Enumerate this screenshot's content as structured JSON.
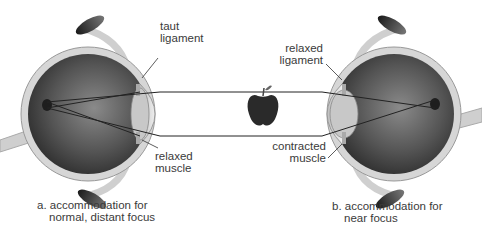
{
  "diagram": {
    "object": "apple-icon",
    "colors": {
      "eyeball_dark": "#3a3a3a",
      "eyeball_mid": "#6e6e6e",
      "sclera": "#d4d4d4",
      "lens": "#c9c9c9",
      "ray": "#222222",
      "apple": "#2a2a2a"
    },
    "panels": [
      {
        "id": "a",
        "caption_line1": "a. accommodation for",
        "caption_line2": "normal, distant focus",
        "ligament_label_line1": "taut",
        "ligament_label_line2": "ligament",
        "muscle_label_line1": "relaxed",
        "muscle_label_line2": "muscle"
      },
      {
        "id": "b",
        "caption_line1": "b. accommodation for",
        "caption_line2": "near focus",
        "ligament_label_line1": "relaxed",
        "ligament_label_line2": "ligament",
        "muscle_label_line1": "contracted",
        "muscle_label_line2": "muscle"
      }
    ]
  }
}
